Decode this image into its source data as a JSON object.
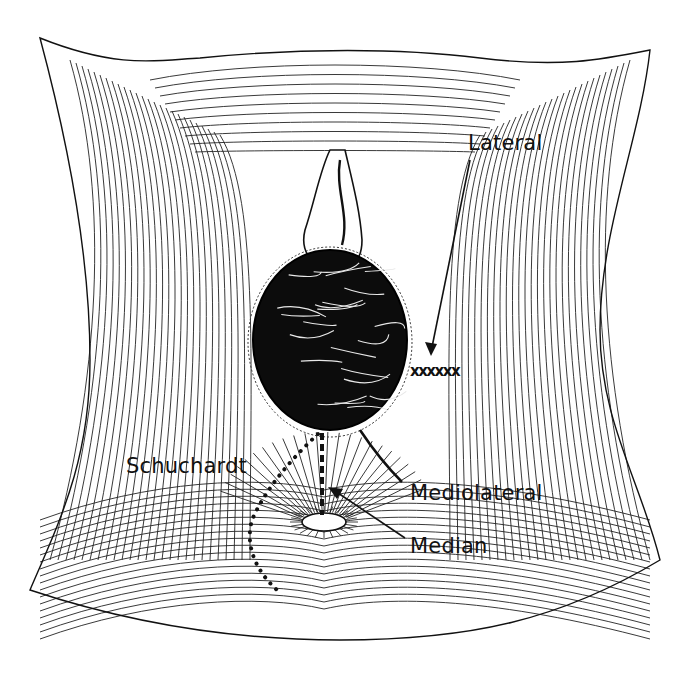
{
  "diagram": {
    "colors": {
      "ink": "#111111",
      "background": "#ffffff"
    },
    "labels": {
      "lateral": {
        "text": "Lateral",
        "x": 468,
        "y": 133
      },
      "mediolateral": {
        "text": "Mediolateral",
        "x": 410,
        "y": 483
      },
      "median": {
        "text": "Median",
        "x": 410,
        "y": 536
      },
      "schuchardt": {
        "text": "Schuchardt",
        "x": 126,
        "y": 456
      }
    },
    "incisions": [
      {
        "name": "Lateral",
        "style": "cross-stitch row"
      },
      {
        "name": "Mediolateral",
        "style": "solid line"
      },
      {
        "name": "Median",
        "style": "dashed vertical line"
      },
      {
        "name": "Schuchardt",
        "style": "dotted curve"
      }
    ]
  }
}
